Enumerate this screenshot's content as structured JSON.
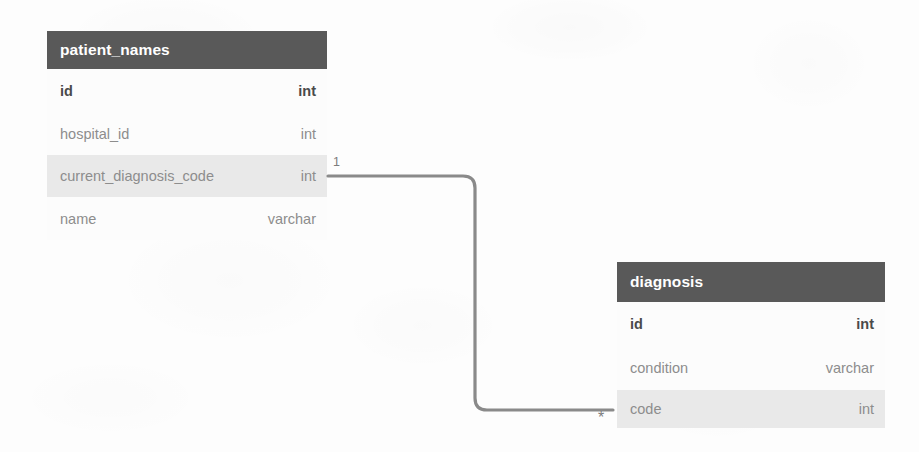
{
  "diagram": {
    "type": "entity-relationship-diagram",
    "colors": {
      "header_background": "#595959",
      "header_text": "#ffffff",
      "row_highlight": "#e9e9e9",
      "attribute_text": "#8d8d8d",
      "key_text": "#4a4a4a",
      "connector_line": "#8a8a8a",
      "canvas_background": "#fdfdfd"
    },
    "entities": [
      {
        "name": "patient_names",
        "attributes": [
          {
            "name": "id",
            "type": "int",
            "is_key": true,
            "highlighted": false
          },
          {
            "name": "hospital_id",
            "type": "int",
            "is_key": false,
            "highlighted": false
          },
          {
            "name": "current_diagnosis_code",
            "type": "int",
            "is_key": false,
            "highlighted": true
          },
          {
            "name": "name",
            "type": "varchar",
            "is_key": false,
            "highlighted": false
          }
        ]
      },
      {
        "name": "diagnosis",
        "attributes": [
          {
            "name": "id",
            "type": "int",
            "is_key": true,
            "highlighted": false
          },
          {
            "name": "condition",
            "type": "varchar",
            "is_key": false,
            "highlighted": false
          },
          {
            "name": "code",
            "type": "int",
            "is_key": false,
            "highlighted": true
          }
        ]
      }
    ],
    "relationship": {
      "from_entity": "patient_names",
      "from_attribute": "current_diagnosis_code",
      "to_entity": "diagnosis",
      "to_attribute": "code",
      "source_cardinality": "1",
      "target_cardinality": "*"
    }
  }
}
